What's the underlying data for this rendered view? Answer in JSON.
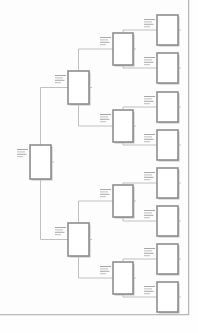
{
  "document": {
    "kind": "page-thumbnail",
    "page_background": "#fdfdfd",
    "page_border_color": "#b9b9b9",
    "width": 198,
    "height": 333
  },
  "diagram": {
    "type": "tree",
    "orientation": "left-to-right",
    "levels": 4,
    "node_fill": "#ffffff",
    "node_stroke": "#8e8e8e",
    "shadow_color": "#c2c2c2",
    "connector_color": "#b0b0b0",
    "label_color": "#a8a8a8",
    "label_legible": false,
    "node_counts": [
      1,
      2,
      4,
      8
    ],
    "nodes": [
      {
        "id": "n0",
        "level": 1,
        "x": 30,
        "y": 145,
        "w": 21,
        "h": 34,
        "label": ""
      },
      {
        "id": "n1",
        "level": 2,
        "x": 68,
        "y": 71,
        "w": 21,
        "h": 33,
        "label": ""
      },
      {
        "id": "n2",
        "level": 2,
        "x": 68,
        "y": 223,
        "w": 21,
        "h": 33,
        "label": ""
      },
      {
        "id": "n1a",
        "level": 3,
        "x": 113,
        "y": 33,
        "w": 20,
        "h": 32,
        "label": ""
      },
      {
        "id": "n1b",
        "level": 3,
        "x": 113,
        "y": 110,
        "w": 20,
        "h": 32,
        "label": ""
      },
      {
        "id": "n2a",
        "level": 3,
        "x": 113,
        "y": 185,
        "w": 20,
        "h": 32,
        "label": ""
      },
      {
        "id": "n2b",
        "level": 3,
        "x": 113,
        "y": 262,
        "w": 20,
        "h": 32,
        "label": ""
      },
      {
        "id": "l1",
        "level": 4,
        "x": 157,
        "y": 15,
        "w": 21,
        "h": 30,
        "label": ""
      },
      {
        "id": "l2",
        "level": 4,
        "x": 157,
        "y": 53,
        "w": 21,
        "h": 30,
        "label": ""
      },
      {
        "id": "l3",
        "level": 4,
        "x": 157,
        "y": 92,
        "w": 21,
        "h": 30,
        "label": ""
      },
      {
        "id": "l4",
        "level": 4,
        "x": 157,
        "y": 130,
        "w": 21,
        "h": 30,
        "label": ""
      },
      {
        "id": "l5",
        "level": 4,
        "x": 157,
        "y": 168,
        "w": 21,
        "h": 30,
        "label": ""
      },
      {
        "id": "l6",
        "level": 4,
        "x": 157,
        "y": 206,
        "w": 21,
        "h": 30,
        "label": ""
      },
      {
        "id": "l7",
        "level": 4,
        "x": 157,
        "y": 244,
        "w": 21,
        "h": 30,
        "label": ""
      },
      {
        "id": "l8",
        "level": 4,
        "x": 157,
        "y": 282,
        "w": 21,
        "h": 30,
        "label": ""
      }
    ],
    "edges": [
      {
        "from": "n0",
        "to": "n1"
      },
      {
        "from": "n0",
        "to": "n2"
      },
      {
        "from": "n1",
        "to": "n1a"
      },
      {
        "from": "n1",
        "to": "n1b"
      },
      {
        "from": "n2",
        "to": "n2a"
      },
      {
        "from": "n2",
        "to": "n2b"
      },
      {
        "from": "n1a",
        "to": "l1"
      },
      {
        "from": "n1a",
        "to": "l2"
      },
      {
        "from": "n1b",
        "to": "l3"
      },
      {
        "from": "n1b",
        "to": "l4"
      },
      {
        "from": "n2a",
        "to": "l5"
      },
      {
        "from": "n2a",
        "to": "l6"
      },
      {
        "from": "n2b",
        "to": "l7"
      },
      {
        "from": "n2b",
        "to": "l8"
      }
    ]
  }
}
